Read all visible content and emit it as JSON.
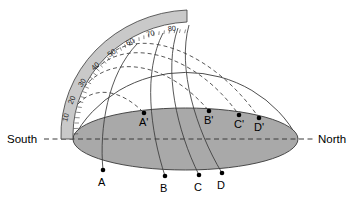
{
  "diagram": {
    "colors": {
      "horizon_fill": "#a9a9a9",
      "protractor_fill": "#c9c9c9",
      "stroke": "#3a3a3a",
      "background": "#ffffff",
      "point_fill": "#000000"
    },
    "cardinal": {
      "south_label": "South",
      "north_label": "North"
    },
    "protractor": {
      "tick_labels": [
        "10",
        "20",
        "30",
        "40",
        "50",
        "60",
        "70",
        "80"
      ],
      "tick_values": [
        10,
        20,
        30,
        40,
        50,
        60,
        70,
        80
      ],
      "unit": "degrees altitude"
    },
    "points_horizon_far": [
      {
        "label": "A'",
        "x": 144,
        "y": 113
      },
      {
        "label": "B'",
        "x": 209,
        "y": 111
      },
      {
        "label": "C'",
        "x": 239,
        "y": 115
      },
      {
        "label": "D'",
        "x": 259,
        "y": 118
      }
    ],
    "points_horizon_near": [
      {
        "label": "A",
        "x": 103,
        "y": 170
      },
      {
        "label": "B",
        "x": 165,
        "y": 176
      },
      {
        "label": "C",
        "x": 199,
        "y": 175
      },
      {
        "label": "D",
        "x": 222,
        "y": 173
      }
    ],
    "arcs": {
      "solid_count": 4,
      "dashed_count": 4,
      "solid_note": "sun paths",
      "dashed_note": "projected paths"
    }
  }
}
